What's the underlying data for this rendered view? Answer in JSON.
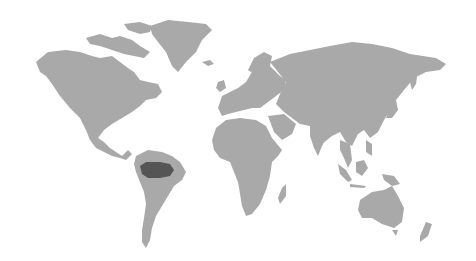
{
  "map": {
    "type": "world-map",
    "projection": "equirectangular-like",
    "colors": {
      "background": "#ffffff",
      "land": "#a9a9a9",
      "highlight": "#555555"
    },
    "highlighted_region": {
      "name": "Amazon rainforest basin",
      "location": "northern South America"
    },
    "alt_text": "World map with the Amazon basin highlighted in dark gray"
  }
}
